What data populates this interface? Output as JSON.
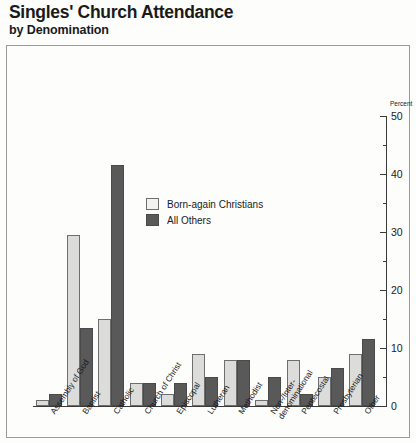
{
  "chart_data": {
    "type": "bar",
    "title": "Singles' Church Attendance",
    "subtitle": "by Denomination",
    "xlabel": "",
    "ylabel": "Percent",
    "ylim": [
      0,
      50
    ],
    "yticks": [
      0,
      10,
      20,
      30,
      40,
      50
    ],
    "ytick_labels": [
      "0",
      "10",
      "20",
      "30",
      "40",
      "50"
    ],
    "minor_ticks": [
      5,
      15,
      25,
      35,
      45
    ],
    "grid": false,
    "legend_position": "inside-upper-center",
    "categories": [
      "Assembly of God",
      "Baptist",
      "Catholic",
      "Church of Christ",
      "Episcopal",
      "Lutheran",
      "Methodist",
      "Non-/Inter-\ndenominational",
      "Pentecostal",
      "Presbyterian",
      "Other"
    ],
    "series": [
      {
        "name": "Born-again Christians",
        "color": "#dcdcda",
        "values": [
          1,
          29.5,
          15,
          4,
          2,
          9,
          8,
          1,
          8,
          5,
          9
        ]
      },
      {
        "name": "All Others",
        "color": "#59595a",
        "values": [
          2,
          13.5,
          41.5,
          4,
          4,
          5,
          8,
          5,
          2,
          6.5,
          11.5
        ]
      }
    ]
  },
  "legend": [
    {
      "label": "Born-again Christians",
      "swatch": "light"
    },
    {
      "label": "All Others",
      "swatch": "dark"
    }
  ]
}
